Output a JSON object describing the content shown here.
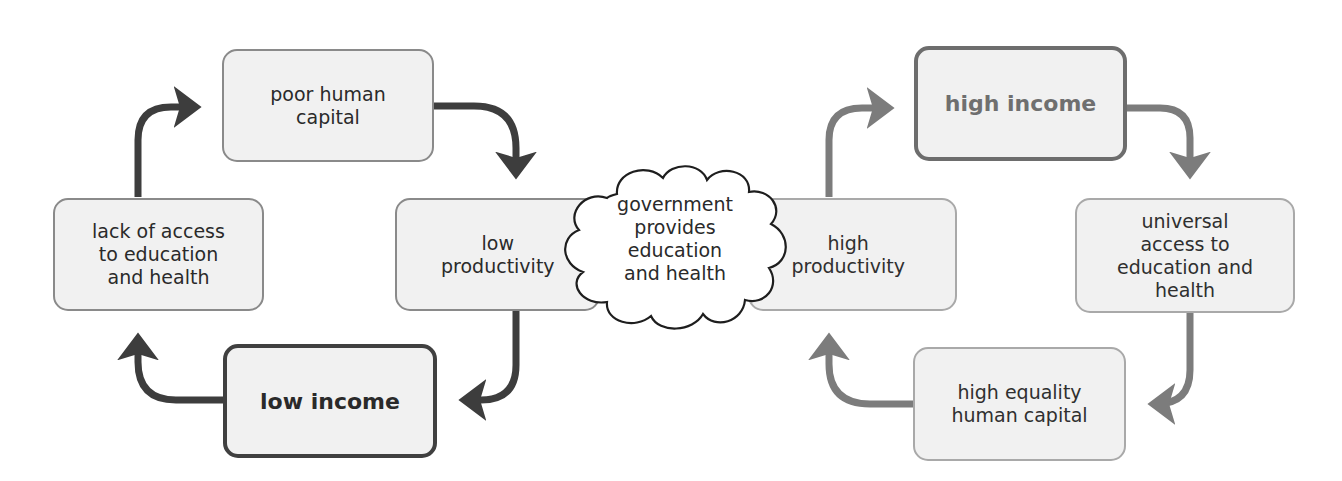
{
  "diagram": {
    "type": "cycle-comparison",
    "colors": {
      "left_cycle_arrow": "#3d3d3d",
      "right_cycle_arrow": "#7c7c7c",
      "box_fill": "#f1f1f1",
      "box_border": "#8a8a8a"
    },
    "left_cycle": {
      "nodes": [
        {
          "id": "poor-human-capital",
          "label": "poor human\ncapital"
        },
        {
          "id": "low-productivity",
          "label": "low\nproductivity"
        },
        {
          "id": "low-income",
          "label": "low income",
          "emphasis": "bold"
        },
        {
          "id": "lack-of-access",
          "label": "lack of access\nto education\nand health"
        }
      ],
      "edges": [
        [
          "poor-human-capital",
          "low-productivity"
        ],
        [
          "low-productivity",
          "low-income"
        ],
        [
          "low-income",
          "lack-of-access"
        ],
        [
          "lack-of-access",
          "poor-human-capital"
        ]
      ]
    },
    "intervention": {
      "shape": "cloud",
      "label": "government\nprovides\neducation\nand health"
    },
    "right_cycle": {
      "nodes": [
        {
          "id": "high-income",
          "label": "high income",
          "emphasis": "bold"
        },
        {
          "id": "universal-access",
          "label": "universal\naccess to\neducation and\nhealth"
        },
        {
          "id": "high-equality-human-capital",
          "label": "high equality\nhuman capital"
        },
        {
          "id": "high-productivity",
          "label": "high\nproductivity"
        }
      ],
      "edges": [
        [
          "high-income",
          "universal-access"
        ],
        [
          "universal-access",
          "high-equality-human-capital"
        ],
        [
          "high-equality-human-capital",
          "high-productivity"
        ],
        [
          "high-productivity",
          "high-income"
        ]
      ]
    }
  }
}
